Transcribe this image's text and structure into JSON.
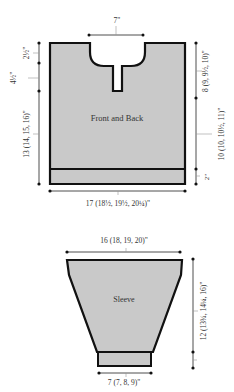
{
  "colors": {
    "fill": "#c9c9c9",
    "outline": "#111111",
    "dimension_line": "#222222",
    "text": "#333333",
    "background": "#ffffff"
  },
  "front_back": {
    "label": "Front and Back",
    "neck_width": "7\"",
    "neck_depth": "2½\"",
    "placket_depth": "4½\"",
    "length_to_placket": "13 (14, 15, 16)\"",
    "armhole_depth": "8 (9, 9½, 10)\"",
    "side_to_armhole": "10 (10, 10½, 11)\"",
    "ribbing": "2\"",
    "width": "17 (18½, 19½, 20¼)\""
  },
  "sleeve": {
    "label": "Sleeve",
    "top_width": "16 (18, 19, 20)\"",
    "length": "12 (13¾, 14¼, 16)\"",
    "cuff_width": "7 (7, 8, 9)\""
  }
}
